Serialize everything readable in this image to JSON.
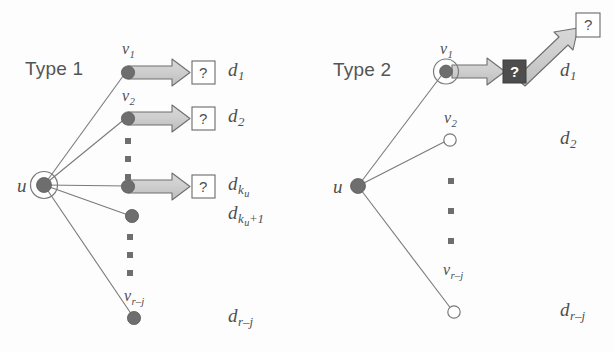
{
  "figure": {
    "width": 614,
    "height": 352,
    "background": "#fdfdfd"
  },
  "colors": {
    "node_fill_dark": "#6e6e6e",
    "node_fill_open": "#ffffff",
    "node_stroke": "#6a6a6a",
    "edge_stroke": "#7a7a7a",
    "arrow_fill": "#c9c9c9",
    "arrow_stroke": "#6e6e6e",
    "box_dark_fill": "#4d4d4d",
    "box_light_fill": "#ffffff",
    "box_stroke": "#6a6a6a",
    "text": "#4f4f4f",
    "dots": "#6e6e6e"
  },
  "panels": [
    {
      "id": "type-1",
      "title": "Type 1",
      "center_node": {
        "label": "u",
        "style": "filled-with-ring"
      },
      "neighbors": [
        {
          "label": "v",
          "sub": "1",
          "style": "filled",
          "has_arrow": true,
          "box": "light",
          "box_text": "?",
          "d_label": "d",
          "d_sub": "1"
        },
        {
          "label": "v",
          "sub": "2",
          "style": "filled",
          "has_arrow": true,
          "box": "light",
          "box_text": "?",
          "d_label": "d",
          "d_sub": "2"
        },
        {
          "label": "v",
          "sub": "k_u",
          "style": "filled",
          "has_arrow": true,
          "box": "light",
          "box_text": "?",
          "d_label": "d",
          "d_sub": "k",
          "d_subsub": "u"
        },
        {
          "label": "v",
          "sub": "k_u+1",
          "style": "filled",
          "has_arrow": false,
          "d_label": "d",
          "d_sub": "k",
          "d_subsub": "u",
          "d_subtail": "+1"
        },
        {
          "label": "v",
          "sub": "r–j",
          "style": "filled",
          "has_arrow": false,
          "d_label": "d",
          "d_sub": "r–j"
        }
      ],
      "ellipses": 2
    },
    {
      "id": "type-2",
      "title": "Type 2",
      "center_node": {
        "label": "u",
        "style": "filled"
      },
      "neighbors": [
        {
          "label": "v",
          "sub": "1",
          "style": "filled-with-ring",
          "has_arrow": true,
          "box": "dark",
          "box_text": "?",
          "second_box": "light",
          "second_box_text": "?",
          "d_label": "d",
          "d_sub": "1"
        },
        {
          "label": "v",
          "sub": "2",
          "style": "open",
          "has_arrow": false,
          "d_label": "d",
          "d_sub": "2"
        },
        {
          "label": "v",
          "sub": "r–j",
          "style": "open",
          "has_arrow": false,
          "d_label": "d",
          "d_sub": "r–j"
        }
      ],
      "ellipses": 1
    }
  ],
  "labels": {
    "type1_title": "Type 1",
    "type2_title": "Type 2",
    "u": "u",
    "v": "v",
    "d": "d",
    "question": "?",
    "sub_1": "1",
    "sub_2": "2",
    "sub_ku": "k",
    "sub_u": "u",
    "sub_ku_plus1_tail": "+1",
    "sub_rj": "r–j"
  }
}
